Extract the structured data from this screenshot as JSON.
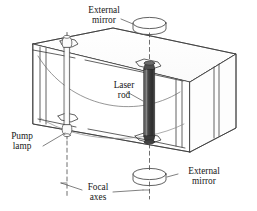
{
  "figure": {
    "background_color": "#ffffff",
    "line_color": "#3a3a3a",
    "rod_color": "#4a4a4a",
    "lamp_color": "#fdfdfd",
    "text_color": "#171717"
  },
  "labels": {
    "external_mirror_top_line1": "External",
    "external_mirror_top_line2": "mirror",
    "laser_rod_line1": "Laser",
    "laser_rod_line2": "rod",
    "pump_lamp_line1": "Pump",
    "pump_lamp_line2": "lamp",
    "focal_axes_line1": "Focal",
    "focal_axes_line2": "axes",
    "external_mirror_bottom_line1": "External",
    "external_mirror_bottom_line2": "mirror"
  },
  "components": {
    "cavity_block": "elliptical pump cavity housing",
    "laser_rod": "laser rod",
    "pump_lamp": "flashlamp pump lamp",
    "mirror_top": "external mirror disk",
    "mirror_bottom": "external mirror disk",
    "focal_axis_lamp": "dashed focal axis through pump lamp",
    "focal_axis_rod": "dashed focal axis through laser rod",
    "reflector_arc": "elliptical reflector cross-section"
  }
}
